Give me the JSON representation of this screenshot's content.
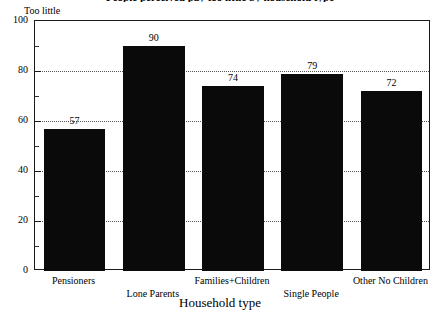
{
  "chart_data": {
    "type": "bar",
    "title": "People perceived pay too little by household type",
    "series_label": "Too little",
    "categories": [
      "Pensioners",
      "Lone Parents",
      "Families+Children",
      "Single People",
      "Other No Children"
    ],
    "values": [
      57,
      90,
      74,
      79,
      72
    ],
    "xlabel": "Household type",
    "ylabel": "",
    "ylim": [
      0,
      100
    ],
    "ytick_labels": [
      "0",
      "20",
      "40",
      "60",
      "80",
      "100"
    ],
    "ytick_values": [
      0,
      20,
      40,
      60,
      80,
      100
    ],
    "yminor_values": [
      10,
      30,
      50,
      70,
      90
    ],
    "grid": true,
    "grid_axis": "y",
    "legend_position": "top-left",
    "bar_color": "#0a0a0a",
    "frame_color": "#1a1a1a",
    "grid_color": "#555555",
    "show_value_labels": true,
    "label_stagger": [
      0,
      1,
      0,
      1,
      0
    ]
  }
}
